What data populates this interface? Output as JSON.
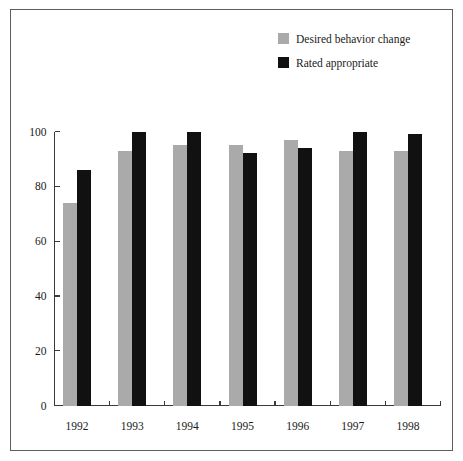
{
  "chart_data": {
    "type": "bar",
    "title": "",
    "xlabel": "",
    "ylabel": "",
    "categories": [
      "1992",
      "1993",
      "1994",
      "1995",
      "1996",
      "1997",
      "1998"
    ],
    "series": [
      {
        "name": "Desired behavior change",
        "color": "#aaaaaa",
        "values": [
          74,
          93,
          95,
          95,
          97,
          93,
          93
        ]
      },
      {
        "name": "Rated appropriate",
        "color": "#111111",
        "values": [
          86,
          100,
          100,
          92,
          94,
          100,
          99
        ]
      }
    ],
    "ylim": [
      0,
      100
    ],
    "yticks": [
      0,
      20,
      40,
      60,
      80,
      100
    ],
    "ytick_labels": [
      "0",
      "20",
      "40",
      "60",
      "80",
      "100"
    ],
    "grid": false,
    "legend_position": "top-right",
    "frame_color": "#5d5d5d",
    "axis_color": "#3a3a3a",
    "background": "#ffffff"
  },
  "legend": {
    "entries": [
      {
        "label": "Desired behavior change",
        "swatch": "#aaaaaa"
      },
      {
        "label": "Rated appropriate",
        "swatch": "#111111"
      }
    ]
  }
}
